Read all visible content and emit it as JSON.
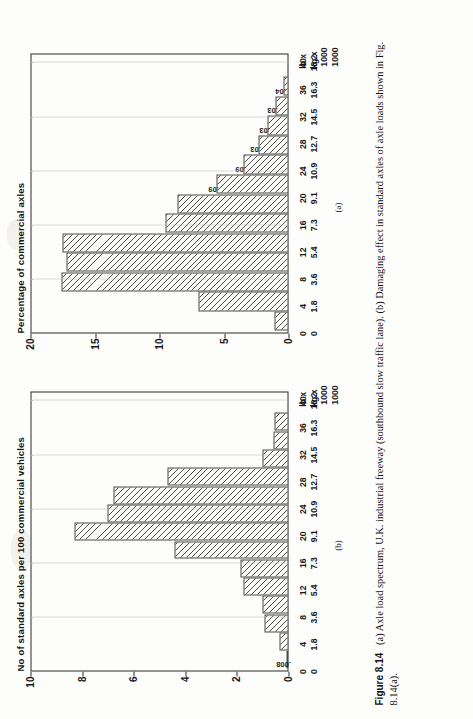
{
  "figure": {
    "number": "Figure 8.14",
    "caption_a": "(a) Axle load spectrum, U.K. industrial freeway (southbound slow traffic lane).",
    "caption_b": "(b) Damaging effect in standard axles of axle loads shown in Fig. 8.14(a).",
    "panel_a_tag": "(a)",
    "panel_b_tag": "(b)"
  },
  "axis_units": {
    "row1": "lb x",
    "row2": "1000",
    "row3": "kg x",
    "row4": "1000"
  },
  "chart_data": [
    {
      "id": "a",
      "type": "bar",
      "title": "Percentage of commercial axles",
      "ylabel": "Percentage of commercial axles",
      "xlabel": "",
      "ylim": [
        0,
        20
      ],
      "yticks": [
        0,
        5,
        10,
        15,
        20
      ],
      "grid": true,
      "legend": "none",
      "categories_lb": [
        "0",
        "4",
        "8",
        "12",
        "16",
        "20",
        "24",
        "28",
        "32",
        "36",
        "40"
      ],
      "categories_kg": [
        "0",
        "1.8",
        "3.6",
        "5.4",
        "7.3",
        "9.1",
        "10.9",
        "12.7",
        "14.5",
        "16.3",
        "18.2"
      ],
      "values": [
        1.1,
        7.0,
        17.6,
        17.2,
        17.5,
        9.5,
        8.6,
        5.6,
        3.5,
        2.3,
        1.6,
        1.0,
        0.4
      ],
      "bar_labels": [
        "",
        "",
        "",
        "",
        "",
        "",
        "",
        ".09",
        ".09",
        ".03",
        ".03",
        ".03",
        ".04"
      ],
      "n_bars": 13
    },
    {
      "id": "b",
      "type": "bar",
      "title": "No of standard axles per 100 commercial  vehicles",
      "ylabel": "No of standard axles per 100 commercial  vehicles",
      "xlabel": "",
      "ylim": [
        0,
        10
      ],
      "yticks": [
        0,
        2,
        4,
        6,
        8,
        10
      ],
      "grid": true,
      "legend": "none",
      "categories_lb": [
        "0",
        "4",
        "8",
        "12",
        "16",
        "20",
        "24",
        "28",
        "32",
        "36",
        "40"
      ],
      "categories_kg": [
        "0",
        "1.8",
        "3.6",
        "5.4",
        "7.3",
        "9.1",
        "10.9",
        "12.7",
        "14.5",
        "16.3",
        "18.2"
      ],
      "values": [
        0.06,
        0.35,
        0.95,
        1.0,
        1.75,
        1.85,
        4.4,
        8.3,
        7.0,
        6.8,
        4.7,
        1.0,
        0.6,
        0.55
      ],
      "bar_labels": [
        ".008",
        "",
        "",
        "",
        "",
        "",
        "",
        "",
        "",
        "",
        "",
        "",
        "",
        ""
      ],
      "n_bars": 14
    }
  ]
}
